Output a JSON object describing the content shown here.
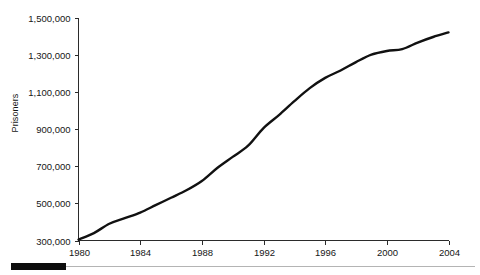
{
  "chart_data": {
    "type": "line",
    "title": "",
    "xlabel": "",
    "ylabel": "Prisoners",
    "xlim": [
      1980,
      2004
    ],
    "ylim": [
      300000,
      1500000
    ],
    "grid": false,
    "legend": null,
    "xticks": [
      "1980",
      "1984",
      "1988",
      "1992",
      "1996",
      "2000",
      "2004"
    ],
    "xtick_values": [
      1980,
      1984,
      1988,
      1992,
      1996,
      2000,
      2004
    ],
    "yticks": [
      "300,000",
      "500,000",
      "700,000",
      "900,000",
      "1,100,000",
      "1,300,000",
      "1,500,000"
    ],
    "ytick_values": [
      300000,
      500000,
      700000,
      900000,
      1100000,
      1300000,
      1500000
    ],
    "series": [
      {
        "name": "Prisoners",
        "color": "#111111",
        "x": [
          1980,
          1981,
          1982,
          1983,
          1984,
          1985,
          1986,
          1987,
          1988,
          1989,
          1990,
          1991,
          1992,
          1993,
          1994,
          1995,
          1996,
          1997,
          1998,
          1999,
          2000,
          2001,
          2002,
          2003,
          2004
        ],
        "values": [
          305000,
          340000,
          390000,
          420000,
          450000,
          490000,
          530000,
          570000,
          620000,
          690000,
          750000,
          810000,
          905000,
          975000,
          1050000,
          1120000,
          1175000,
          1215000,
          1260000,
          1300000,
          1320000,
          1330000,
          1365000,
          1395000,
          1420000
        ]
      }
    ]
  },
  "axes": {
    "ylabel": "Prisoners"
  },
  "footer": {
    "rule_color": "#0d0d0d",
    "thin_rule_color": "#b4b4b4"
  }
}
